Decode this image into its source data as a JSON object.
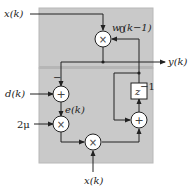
{
  "diagram": {
    "colors": {
      "panel": "#c9c9c9",
      "panel_border": "#b0b0b0",
      "divider": "#b6b6b6",
      "line": "#222222",
      "node_fill": "#ffffff"
    },
    "labels": {
      "input_top": "x(k)",
      "weight": "w",
      "weight_sub": "0",
      "weight_arg": "(k−1)",
      "output": "y(k)",
      "desired": "d(k)",
      "minus_sign": "−",
      "error": "e(k)",
      "step": "2μ",
      "input_bottom": "x(k)",
      "delay": "z",
      "delay_exp": "−1"
    },
    "nodes": [
      {
        "id": "mult-top",
        "type": "multiply",
        "symbol": "×"
      },
      {
        "id": "sum-error",
        "type": "add",
        "symbol": "+"
      },
      {
        "id": "mult-mu",
        "type": "multiply",
        "symbol": "×"
      },
      {
        "id": "mult-bottom",
        "type": "multiply",
        "symbol": "×"
      },
      {
        "id": "sum-update",
        "type": "add",
        "symbol": "+"
      },
      {
        "id": "delay",
        "type": "delay",
        "symbol": "z^-1"
      }
    ]
  }
}
